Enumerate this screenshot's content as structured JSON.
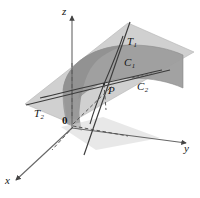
{
  "figure": {
    "background_color": "#ffffff",
    "axes": {
      "x_label": "x",
      "y_label": "y",
      "z_label": "z",
      "origin_label": "0"
    },
    "points": [
      {
        "name": "point-p",
        "label": "P"
      }
    ],
    "curves": [
      {
        "name": "curve-c1",
        "label": "C",
        "subscript": "1"
      },
      {
        "name": "curve-c2",
        "label": "C",
        "subscript": "2"
      }
    ],
    "tangent_lines": [
      {
        "name": "tangent-t1",
        "label": "T",
        "subscript": "1"
      },
      {
        "name": "tangent-t2",
        "label": "T",
        "subscript": "2"
      }
    ],
    "colors": {
      "tangent_plane_fill": "#c9c9c9",
      "surface_fill": "#a6a6a6",
      "surface_fill_dark": "#9a9a9a",
      "stroke": "#3a3a3a",
      "axis_stroke": "#555555",
      "label_color": "#151515",
      "background": "#ffffff"
    }
  }
}
